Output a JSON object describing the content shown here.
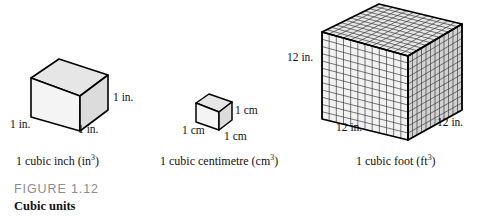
{
  "figure": {
    "number": "FIGURE 1.12",
    "title": "Cubic units"
  },
  "colors": {
    "top_face": "#e6e6e6",
    "left_face": "#f4f4f4",
    "right_face": "#d9d9d9",
    "outline": "#000000",
    "grid_line": "#3a3a3a",
    "figure_number_gray": "#8d8d8d",
    "text_black": "#111111",
    "background": "#ffffff"
  },
  "cubes": [
    {
      "id": "cubic-inch",
      "caption_text": "1 cubic inch (in",
      "caption_exponent": "3",
      "caption_tail": ")",
      "edge_labels": {
        "right": "1 in.",
        "left": "1 in.",
        "front": "1 in."
      }
    },
    {
      "id": "cubic-centimetre",
      "caption_text": "1 cubic centimetre (cm",
      "caption_exponent": "3",
      "caption_tail": ")",
      "edge_labels": {
        "right": "1 cm",
        "left": "1 cm",
        "front": "1 cm"
      }
    },
    {
      "id": "cubic-foot",
      "caption_text": "1 cubic foot (ft",
      "caption_exponent": "3",
      "caption_tail": ")",
      "edge_labels": {
        "left": "12 in.",
        "front": "12 in.",
        "right": "12 in."
      },
      "grid": {
        "divisions": 12,
        "note": "12 by 12 unit grid ruled on each visible face"
      }
    }
  ]
}
